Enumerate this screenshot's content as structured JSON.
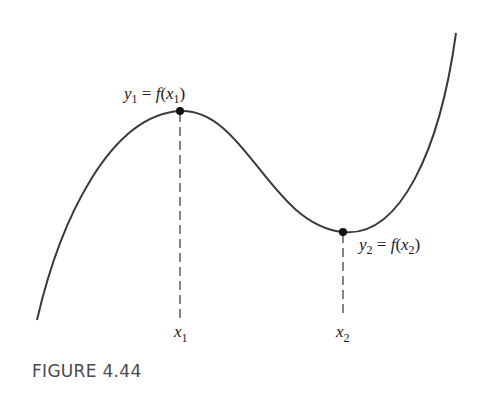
{
  "figure": {
    "caption": "FIGURE 4.44",
    "colors": {
      "curve": "#3a3a3a",
      "points": "#111111",
      "dashes": "#444444",
      "caption": "#4a4a4a"
    },
    "curve": {
      "description": "Smooth cubic-like curve rising from lower left to a local maximum, falling to a local minimum, then rising steeply to upper right",
      "path_points": [
        [
          37,
          320
        ],
        [
          180,
          111
        ],
        [
          343,
          232
        ],
        [
          456,
          33
        ]
      ]
    },
    "points": [
      {
        "id": "max",
        "x": 180,
        "y": 111,
        "label": {
          "var": "y",
          "var_sub": "1",
          "eq": " = ",
          "func": "f",
          "arg": "x",
          "arg_sub": "1"
        },
        "x_label": {
          "var": "x",
          "sub": "1"
        }
      },
      {
        "id": "min",
        "x": 343,
        "y": 232,
        "label": {
          "var": "y",
          "var_sub": "2",
          "eq": " = ",
          "func": "f",
          "arg": "x",
          "arg_sub": "2"
        },
        "x_label": {
          "var": "x",
          "sub": "2"
        }
      }
    ]
  }
}
